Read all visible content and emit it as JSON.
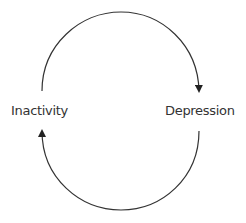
{
  "diagram": {
    "type": "cycle",
    "nodes": [
      {
        "id": "inactivity",
        "label": "Inactivity"
      },
      {
        "id": "depression",
        "label": "Depression"
      }
    ],
    "edges": [
      {
        "from": "inactivity",
        "to": "depression",
        "path": "upper-arc"
      },
      {
        "from": "depression",
        "to": "inactivity",
        "path": "lower-arc"
      }
    ],
    "colors": {
      "stroke": "#333333",
      "text": "#333333",
      "background": "#ffffff"
    }
  }
}
